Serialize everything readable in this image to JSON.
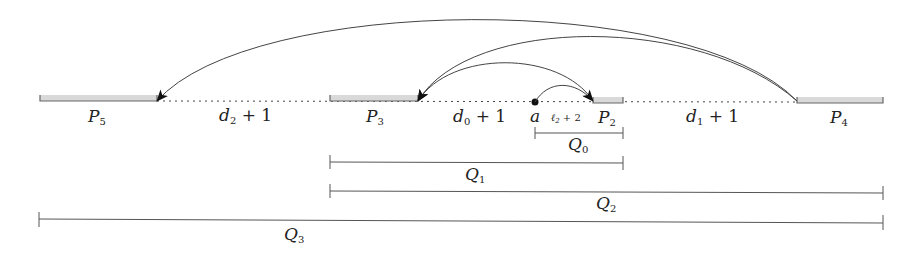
{
  "diagram": {
    "colors": {
      "ink": "#222222",
      "line": "#555555",
      "bar_fill": "#d9d9d9",
      "bar_edge": "#666666"
    },
    "blocks": [
      {
        "id": "P5",
        "label": "P",
        "sub": "5",
        "x1": 40,
        "x2": 157
      },
      {
        "id": "P3",
        "label": "P",
        "sub": "3",
        "x1": 330,
        "x2": 418
      },
      {
        "id": "P2",
        "label": "P",
        "sub": "2",
        "x1": 593,
        "x2": 623
      },
      {
        "id": "P4",
        "label": "P",
        "sub": "4",
        "x1": 797,
        "x2": 883
      }
    ],
    "gaps": [
      {
        "label": "d",
        "sub": "2",
        "rest": " + 1"
      },
      {
        "label": "d",
        "sub": "0",
        "rest": " + 1"
      },
      {
        "label": "d",
        "sub": "1",
        "rest": " + 1"
      }
    ],
    "point": {
      "label": "a"
    },
    "small_gap": {
      "label": "ℓ",
      "sub": "2",
      "rest": " + 2"
    },
    "intervals": [
      {
        "id": "Q0",
        "label": "Q",
        "sub": "0",
        "x1": 535,
        "x2": 623
      },
      {
        "id": "Q1",
        "label": "Q",
        "sub": "1",
        "x1": 330,
        "x2": 623
      },
      {
        "id": "Q2",
        "label": "Q",
        "sub": "2",
        "x1": 330,
        "x2": 883
      },
      {
        "id": "Q3",
        "label": "Q",
        "sub": "3",
        "x1": 39,
        "x2": 883
      }
    ],
    "arrows": [
      {
        "from": "P4",
        "to": "P5"
      },
      {
        "from": "P4",
        "to": "P3"
      },
      {
        "from": "P2",
        "to": "P3"
      },
      {
        "from": "a",
        "to": "P2"
      }
    ]
  }
}
